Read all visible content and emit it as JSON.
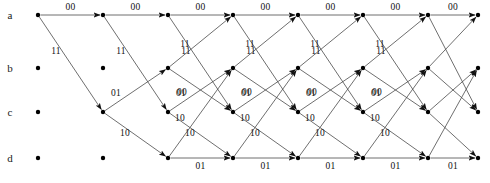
{
  "diagram": {
    "type": "trellis",
    "width": 490,
    "height": 183,
    "line_color": "#4a4a4a",
    "node_color": "#000000",
    "text_color": "#111111",
    "background": "#ffffff",
    "stage_count": 7,
    "column_count": 8,
    "column_x": [
      38,
      103,
      168,
      233,
      298,
      363,
      428,
      478
    ],
    "states": [
      {
        "id": "a",
        "label": "a",
        "y": 15,
        "first_column": 0
      },
      {
        "id": "b",
        "label": "b",
        "y": 68,
        "first_column": 2
      },
      {
        "id": "c",
        "label": "c",
        "y": 112,
        "first_column": 1
      },
      {
        "id": "d",
        "label": "d",
        "y": 158,
        "first_column": 2
      }
    ],
    "state_label_x": 10,
    "node_radius": 2.2,
    "transitions": [
      {
        "from": "a",
        "to": "a",
        "output": "00"
      },
      {
        "from": "a",
        "to": "c",
        "output": "11"
      },
      {
        "from": "b",
        "to": "a",
        "output": "11"
      },
      {
        "from": "b",
        "to": "c",
        "output": "00"
      },
      {
        "from": "c",
        "to": "b",
        "output": "01"
      },
      {
        "from": "c",
        "to": "d",
        "output": "10"
      },
      {
        "from": "d",
        "to": "b",
        "output": "10"
      },
      {
        "from": "d",
        "to": "d",
        "output": "01"
      }
    ],
    "edges": [
      {
        "stage": 0,
        "from": "a",
        "to": "a",
        "label": "00"
      },
      {
        "stage": 0,
        "from": "a",
        "to": "c",
        "label": "11"
      },
      {
        "stage": 1,
        "from": "a",
        "to": "a",
        "label": "00"
      },
      {
        "stage": 1,
        "from": "a",
        "to": "c",
        "label": "11"
      },
      {
        "stage": 1,
        "from": "c",
        "to": "b",
        "label": "01"
      },
      {
        "stage": 1,
        "from": "c",
        "to": "d",
        "label": "10"
      },
      {
        "stage": 2,
        "from": "a",
        "to": "a",
        "label": "00"
      },
      {
        "stage": 2,
        "from": "a",
        "to": "c",
        "label": "11"
      },
      {
        "stage": 2,
        "from": "b",
        "to": "a",
        "label": "11"
      },
      {
        "stage": 2,
        "from": "b",
        "to": "c",
        "label": "00"
      },
      {
        "stage": 2,
        "from": "c",
        "to": "b",
        "label": "01"
      },
      {
        "stage": 2,
        "from": "c",
        "to": "d",
        "label": "10"
      },
      {
        "stage": 2,
        "from": "d",
        "to": "b",
        "label": "10"
      },
      {
        "stage": 2,
        "from": "d",
        "to": "d",
        "label": "01"
      },
      {
        "stage": 3,
        "from": "a",
        "to": "a",
        "label": "00"
      },
      {
        "stage": 3,
        "from": "a",
        "to": "c",
        "label": "11"
      },
      {
        "stage": 3,
        "from": "b",
        "to": "a",
        "label": "11"
      },
      {
        "stage": 3,
        "from": "b",
        "to": "c",
        "label": "00"
      },
      {
        "stage": 3,
        "from": "c",
        "to": "b",
        "label": "01"
      },
      {
        "stage": 3,
        "from": "c",
        "to": "d",
        "label": "10"
      },
      {
        "stage": 3,
        "from": "d",
        "to": "b",
        "label": "10"
      },
      {
        "stage": 3,
        "from": "d",
        "to": "d",
        "label": "01"
      },
      {
        "stage": 4,
        "from": "a",
        "to": "a",
        "label": "00"
      },
      {
        "stage": 4,
        "from": "a",
        "to": "c",
        "label": "11"
      },
      {
        "stage": 4,
        "from": "b",
        "to": "a",
        "label": "11"
      },
      {
        "stage": 4,
        "from": "b",
        "to": "c",
        "label": "00"
      },
      {
        "stage": 4,
        "from": "c",
        "to": "b",
        "label": "01"
      },
      {
        "stage": 4,
        "from": "c",
        "to": "d",
        "label": "10"
      },
      {
        "stage": 4,
        "from": "d",
        "to": "b",
        "label": "10"
      },
      {
        "stage": 4,
        "from": "d",
        "to": "d",
        "label": "01"
      },
      {
        "stage": 5,
        "from": "a",
        "to": "a",
        "label": "00"
      },
      {
        "stage": 5,
        "from": "a",
        "to": "c",
        "label": "11"
      },
      {
        "stage": 5,
        "from": "b",
        "to": "a",
        "label": "11"
      },
      {
        "stage": 5,
        "from": "b",
        "to": "c",
        "label": "00"
      },
      {
        "stage": 5,
        "from": "c",
        "to": "b",
        "label": "01"
      },
      {
        "stage": 5,
        "from": "c",
        "to": "d",
        "label": "10"
      },
      {
        "stage": 5,
        "from": "d",
        "to": "b",
        "label": "10"
      },
      {
        "stage": 5,
        "from": "d",
        "to": "d",
        "label": "01"
      },
      {
        "stage": 6,
        "from": "a",
        "to": "a",
        "label": "00"
      },
      {
        "stage": 6,
        "from": "a",
        "to": "c",
        "label": ""
      },
      {
        "stage": 6,
        "from": "b",
        "to": "a",
        "label": ""
      },
      {
        "stage": 6,
        "from": "b",
        "to": "c",
        "label": ""
      },
      {
        "stage": 6,
        "from": "c",
        "to": "b",
        "label": ""
      },
      {
        "stage": 6,
        "from": "c",
        "to": "d",
        "label": ""
      },
      {
        "stage": 6,
        "from": "d",
        "to": "b",
        "label": ""
      },
      {
        "stage": 6,
        "from": "d",
        "to": "d",
        "label": "01"
      }
    ]
  }
}
